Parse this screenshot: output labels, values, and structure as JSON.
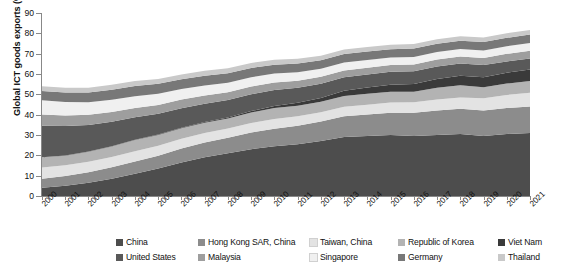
{
  "chart_data": {
    "type": "area",
    "title": "",
    "subtitle": "",
    "xlabel": "",
    "ylabel": "Global ICT goods exports (%)",
    "stacked": true,
    "grid": false,
    "legend_position": "bottom",
    "xlim": [
      2000,
      2021
    ],
    "ylim": [
      0,
      90
    ],
    "yticks": [
      0,
      10,
      20,
      30,
      40,
      50,
      60,
      70,
      80,
      90
    ],
    "ytick_labels": [
      "0",
      "10",
      "20",
      "30",
      "40",
      "50",
      "60",
      "70",
      "80",
      "90"
    ],
    "x": [
      2000,
      2001,
      2002,
      2003,
      2004,
      2005,
      2006,
      2007,
      2008,
      2009,
      2010,
      2011,
      2012,
      2013,
      2014,
      2015,
      2016,
      2017,
      2018,
      2019,
      2020,
      2021
    ],
    "categories": [
      "2000",
      "2001",
      "2002",
      "2003",
      "2004",
      "2005",
      "2006",
      "2007",
      "2008",
      "2009",
      "2010",
      "2011",
      "2012",
      "2013",
      "2014",
      "2015",
      "2016",
      "2017",
      "2018",
      "2019",
      "2020",
      "2021"
    ],
    "series": [
      {
        "name": "China",
        "color": "#4d4d4d",
        "values": [
          4.0,
          5.0,
          6.5,
          8.5,
          11.0,
          13.5,
          16.5,
          19.0,
          21.0,
          23.0,
          24.5,
          25.5,
          27.0,
          29.0,
          29.5,
          30.0,
          29.5,
          30.0,
          30.5,
          29.5,
          30.5,
          31.0
        ]
      },
      {
        "name": "Hong Kong SAR, China",
        "color": "#8c8c8c",
        "values": [
          4.5,
          4.8,
          5.2,
          5.6,
          6.0,
          6.3,
          6.8,
          7.3,
          7.6,
          8.2,
          8.6,
          9.0,
          9.6,
          10.2,
          10.6,
          11.0,
          11.4,
          12.0,
          12.4,
          12.6,
          12.8,
          13.0
        ]
      },
      {
        "name": "Taiwan, China",
        "color": "#e3e3e3",
        "values": [
          5.5,
          5.3,
          5.2,
          5.1,
          5.0,
          4.9,
          4.8,
          4.7,
          4.6,
          4.7,
          4.8,
          4.7,
          4.6,
          4.7,
          4.8,
          5.0,
          5.2,
          5.4,
          5.6,
          6.0,
          6.4,
          6.8
        ]
      },
      {
        "name": "Republic of Korea",
        "color": "#b3b3b3",
        "values": [
          5.0,
          4.7,
          4.9,
          5.2,
          5.5,
          5.3,
          5.2,
          5.0,
          4.9,
          5.2,
          5.4,
          5.2,
          5.1,
          5.3,
          5.4,
          5.3,
          5.2,
          5.8,
          6.0,
          5.4,
          5.6,
          5.8
        ]
      },
      {
        "name": "Viet Nam",
        "color": "#3a3a3a",
        "values": [
          0.1,
          0.1,
          0.1,
          0.1,
          0.2,
          0.2,
          0.3,
          0.4,
          0.5,
          0.7,
          1.0,
          1.4,
          1.9,
          2.6,
          3.0,
          3.4,
          3.8,
          4.3,
          4.6,
          4.9,
          5.3,
          5.6
        ]
      },
      {
        "name": "United States",
        "color": "#595959",
        "values": [
          15.5,
          14.5,
          13.0,
          12.0,
          11.0,
          10.2,
          9.6,
          9.0,
          8.6,
          8.2,
          7.8,
          7.4,
          7.0,
          6.6,
          6.5,
          6.4,
          6.3,
          6.2,
          6.1,
          6.0,
          5.6,
          5.4
        ]
      },
      {
        "name": "Malaysia",
        "color": "#9e9e9e",
        "values": [
          5.5,
          5.2,
          5.0,
          4.8,
          4.6,
          4.4,
          4.2,
          4.0,
          3.8,
          3.8,
          3.7,
          3.5,
          3.4,
          3.3,
          3.3,
          3.3,
          3.3,
          3.4,
          3.4,
          3.5,
          3.7,
          3.8
        ]
      },
      {
        "name": "Singapore",
        "color": "#f0f0f0",
        "values": [
          7.0,
          6.6,
          6.2,
          6.0,
          5.8,
          5.5,
          5.2,
          5.0,
          4.7,
          4.6,
          4.4,
          4.2,
          4.0,
          3.9,
          3.8,
          3.7,
          3.7,
          3.7,
          3.7,
          3.7,
          3.8,
          3.9
        ]
      },
      {
        "name": "Germany",
        "color": "#787878",
        "values": [
          4.6,
          4.7,
          4.8,
          5.0,
          5.0,
          4.9,
          4.8,
          4.8,
          4.7,
          4.6,
          4.4,
          4.3,
          4.2,
          4.2,
          4.2,
          4.1,
          4.1,
          4.1,
          4.1,
          4.1,
          4.1,
          4.1
        ]
      },
      {
        "name": "Thailand",
        "color": "#c9c9c9",
        "values": [
          2.3,
          2.3,
          2.3,
          2.4,
          2.4,
          2.4,
          2.4,
          2.4,
          2.4,
          2.4,
          2.4,
          2.3,
          2.2,
          2.2,
          2.2,
          2.2,
          2.2,
          2.2,
          2.2,
          2.2,
          2.3,
          2.3
        ]
      }
    ],
    "legend": [
      {
        "label": "China",
        "color": "#4d4d4d"
      },
      {
        "label": "Hong Kong SAR, China",
        "color": "#8c8c8c"
      },
      {
        "label": "Taiwan, China",
        "color": "#e3e3e3"
      },
      {
        "label": "Republic of Korea",
        "color": "#b3b3b3"
      },
      {
        "label": "Viet Nam",
        "color": "#3a3a3a"
      },
      {
        "label": "United States",
        "color": "#595959"
      },
      {
        "label": "Malaysia",
        "color": "#9e9e9e"
      },
      {
        "label": "Singapore",
        "color": "#f0f0f0"
      },
      {
        "label": "Germany",
        "color": "#787878"
      },
      {
        "label": "Thailand",
        "color": "#c9c9c9"
      }
    ]
  }
}
